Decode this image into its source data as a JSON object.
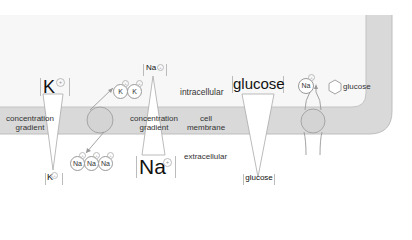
{
  "colors": {
    "cell_interior": "#f7f7f7",
    "membrane": "#d9d9d9",
    "membrane_edge": "#bfbfbf",
    "line": "#9a9a9a",
    "text": "#222222"
  },
  "labels": {
    "intracellular": "intracellular",
    "extracellular": "extracellular",
    "cell_membrane_line1": "cell",
    "cell_membrane_line2": "membrane",
    "gradient_left_line1": "concentration",
    "gradient_left_line2": "gradient",
    "gradient_mid_line1": "concentration",
    "gradient_mid_line2": "gradient"
  },
  "potassium": {
    "inside_large": "K",
    "outside_small": "K",
    "charge": "+",
    "transported": [
      "K",
      "K"
    ]
  },
  "sodium": {
    "inside_small": "Na",
    "outside_large": "Na",
    "charge": "+",
    "transported": [
      "Na",
      "Na",
      "Na"
    ]
  },
  "glucose": {
    "inside_large": "glucose",
    "outside_small": "glucose",
    "symport_na": "Na",
    "symport_glucose": "glucose"
  }
}
